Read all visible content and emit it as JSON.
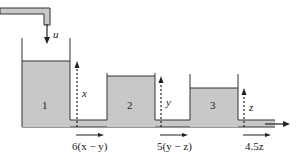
{
  "diagram": {
    "type": "three-tank cascade system",
    "colors": {
      "water": "#c8c8c8",
      "line": "#333333",
      "background": "#ffffff"
    },
    "inflow": {
      "label": "u"
    },
    "tanks": [
      {
        "number": "1",
        "level_label": "x"
      },
      {
        "number": "2",
        "level_label": "y"
      },
      {
        "number": "3",
        "level_label": "z"
      }
    ],
    "flows": [
      {
        "label": "6(x − y)"
      },
      {
        "label": "5(y − z)"
      },
      {
        "label": "4.5z"
      }
    ]
  }
}
